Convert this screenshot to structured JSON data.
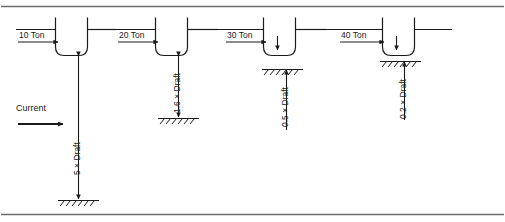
{
  "figure": {
    "border_color": "#6e6e6e",
    "line_color": "#1a1a1a",
    "background": "#ffffff"
  },
  "current": {
    "label": "Current",
    "arrow": "right-arrow-icon"
  },
  "waterline": {
    "label": "waterline"
  },
  "vessels": [
    {
      "id": 1,
      "force_label": "10 Ton",
      "clearance_label": "5 × Draft",
      "force_arrow": "right-arrow-icon",
      "clearance_arrow": "double-vertical-arrow-icon",
      "seabed": "seabed-hatch-icon"
    },
    {
      "id": 2,
      "force_label": "20 Ton",
      "clearance_label": "1.6 × Draft",
      "force_arrow": "right-arrow-icon",
      "clearance_arrow": "double-vertical-arrow-icon",
      "seabed": "seabed-hatch-icon"
    },
    {
      "id": 3,
      "force_label": "30 Ton",
      "clearance_label": "0.5 × Draft",
      "force_arrow": "right-arrow-icon",
      "clearance_arrow": "double-vertical-arrow-icon",
      "seabed": "seabed-hatch-icon"
    },
    {
      "id": 4,
      "force_label": "40 Ton",
      "clearance_label": "0.2 × Draft",
      "force_arrow": "right-arrow-icon",
      "clearance_arrow": "double-vertical-arrow-icon",
      "seabed": "seabed-hatch-icon"
    }
  ]
}
